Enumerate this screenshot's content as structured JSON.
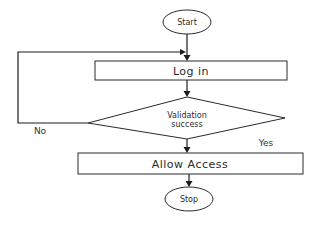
{
  "diagram": {
    "type": "flowchart",
    "nodes": {
      "start": {
        "shape": "ellipse",
        "label": "Start"
      },
      "login": {
        "shape": "process",
        "label": "Log in"
      },
      "validation": {
        "shape": "decision",
        "label_line1": "Validation",
        "label_line2": "success"
      },
      "allow": {
        "shape": "process",
        "label": "Allow Access"
      },
      "stop": {
        "shape": "ellipse",
        "label": "Stop"
      }
    },
    "edges": [
      {
        "from": "start",
        "to": "login",
        "label": ""
      },
      {
        "from": "login",
        "to": "validation",
        "label": ""
      },
      {
        "from": "validation",
        "to": "login",
        "label": "No"
      },
      {
        "from": "validation",
        "to": "allow",
        "label": "Yes"
      },
      {
        "from": "allow",
        "to": "stop",
        "label": ""
      }
    ],
    "edge_labels": {
      "no": "No",
      "yes": "Yes"
    }
  }
}
